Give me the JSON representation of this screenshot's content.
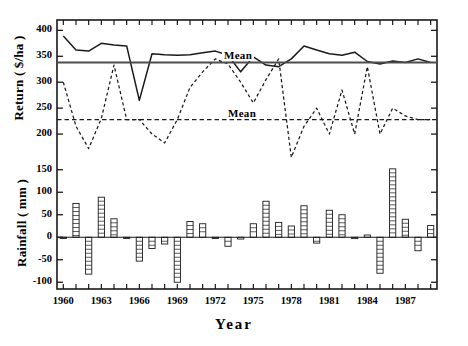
{
  "figure": {
    "xaxis_title": "Year",
    "upper_yaxis_title": "Return ( $/ha )",
    "lower_yaxis_title": "Rainfall ( mm )",
    "mean_label_upper": "Mean",
    "mean_label_lower": "Mean"
  },
  "chart_data": {
    "type": "line",
    "title": "",
    "xlabel": "Year",
    "grid": false,
    "legend": "none",
    "panels": [
      {
        "name": "return-panel",
        "ylabel": "Return ( $/ha )",
        "ylim": [
          150,
          420
        ],
        "yticks": [
          200,
          250,
          300,
          350,
          400
        ],
        "ytick_labels": [
          "200",
          "250",
          "300",
          "350",
          "400"
        ],
        "annotations": [
          {
            "text": "Mean",
            "series": "return-solid",
            "value": 338
          },
          {
            "text": "Mean",
            "series": "return-dashed",
            "value": 228
          }
        ],
        "series": [
          {
            "name": "return-solid",
            "style": "solid",
            "mean": 338,
            "x": [
              1960,
              1961,
              1962,
              1963,
              1964,
              1965,
              1966,
              1967,
              1968,
              1969,
              1970,
              1971,
              1972,
              1973,
              1974,
              1975,
              1976,
              1977,
              1978,
              1979,
              1980,
              1981,
              1982,
              1983,
              1984,
              1985,
              1986,
              1987,
              1988,
              1989
            ],
            "values": [
              389,
              362,
              360,
              375,
              372,
              370,
              265,
              355,
              353,
              352,
              353,
              357,
              360,
              352,
              320,
              349,
              333,
              330,
              345,
              370,
              362,
              355,
              352,
              358,
              340,
              335,
              341,
              338,
              345,
              338
            ]
          },
          {
            "name": "return-dashed",
            "style": "dashed",
            "mean": 228,
            "x": [
              1960,
              1961,
              1962,
              1963,
              1964,
              1965,
              1966,
              1967,
              1968,
              1969,
              1970,
              1971,
              1972,
              1973,
              1974,
              1975,
              1976,
              1977,
              1978,
              1979,
              1980,
              1981,
              1982,
              1983,
              1984,
              1985,
              1986,
              1987,
              1988,
              1989
            ],
            "values": [
              300,
              215,
              172,
              230,
              333,
              228,
              228,
              200,
              183,
              228,
              290,
              320,
              345,
              335,
              300,
              260,
              305,
              345,
              155,
              215,
              250,
              200,
              285,
              200,
              330,
              200,
              250,
              235,
              228,
              228
            ]
          }
        ]
      },
      {
        "name": "rainfall-panel",
        "ylabel": "Rainfall ( mm )",
        "ylim": [
          -115,
          165
        ],
        "yticks": [
          -100,
          -50,
          0,
          50,
          100,
          150
        ],
        "ytick_labels": [
          "-100",
          "-50",
          "0",
          "50",
          "100",
          "150"
        ],
        "series": [
          {
            "name": "rainfall-deviation",
            "style": "bar",
            "x": [
              1960,
              1961,
              1962,
              1963,
              1964,
              1965,
              1966,
              1967,
              1968,
              1969,
              1970,
              1971,
              1972,
              1973,
              1974,
              1975,
              1976,
              1977,
              1978,
              1979,
              1980,
              1981,
              1982,
              1983,
              1984,
              1985,
              1986,
              1987,
              1988,
              1989
            ],
            "values": [
              -2,
              75,
              -82,
              89,
              41,
              -2,
              -53,
              -25,
              -15,
              -100,
              35,
              30,
              -2,
              -20,
              -4,
              30,
              80,
              33,
              25,
              70,
              -13,
              60,
              50,
              -3,
              5,
              -80,
              152,
              40,
              -30,
              26
            ]
          }
        ]
      }
    ],
    "xticks": [
      1960,
      1963,
      1966,
      1969,
      1972,
      1975,
      1978,
      1981,
      1984,
      1987
    ],
    "xtick_labels": [
      "1960",
      "1963",
      "1966",
      "1969",
      "1972",
      "1975",
      "1978",
      "1981",
      "1984",
      "1987"
    ],
    "xlim": [
      1959.5,
      1989.5
    ],
    "minor_xticks_every": 1
  }
}
